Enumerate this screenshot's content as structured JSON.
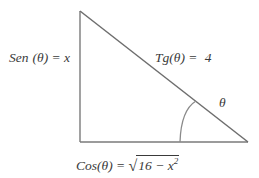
{
  "figure": {
    "type": "right-triangle-trigonometry-diagram",
    "background_color": "#ffffff",
    "stroke_color": "#6e6e6e",
    "text_color": "#3a3a3a",
    "vertices": {
      "apex": [
        80,
        11
      ],
      "right_angle": [
        80,
        142
      ],
      "theta_vertex": [
        248,
        142
      ]
    },
    "angle_arc": {
      "at_vertex": "theta_vertex",
      "base_point": [
        180,
        142
      ],
      "hypotenuse_point": [
        196,
        101
      ]
    }
  },
  "labels": {
    "opposite_side": {
      "function": "Sen",
      "space": " ",
      "argument": "(θ)",
      "equals": " = ",
      "value": "x",
      "full_text": "Sen (θ) = x"
    },
    "tangent": {
      "function": "Tg",
      "argument": "(θ)",
      "equals": " = ",
      "value": "4",
      "full_text": "Tg(θ) =  4"
    },
    "angle": {
      "symbol": "θ"
    },
    "adjacent_side": {
      "function": "Cos",
      "argument": "(θ)",
      "equals": " = ",
      "radical": "√",
      "radicand_base": "16 − x",
      "radicand_exponent": "2",
      "full_text": "Cos(θ) = √(16 − x²)"
    }
  }
}
